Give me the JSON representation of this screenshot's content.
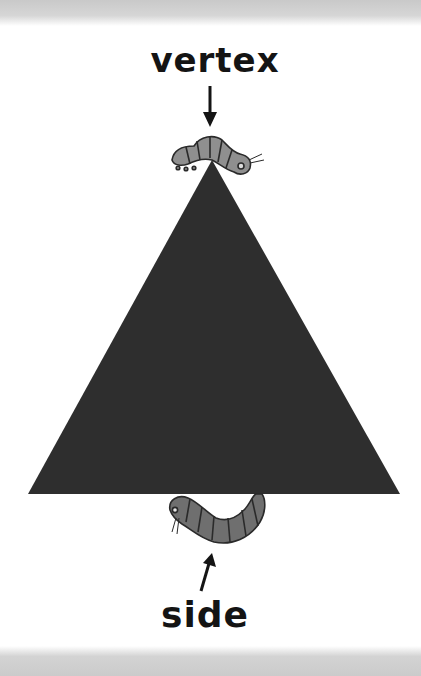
{
  "diagram": {
    "labels": {
      "vertex": "vertex",
      "side": "side"
    },
    "shape": {
      "type": "triangle",
      "fill": "#2e2e2e",
      "points": [
        [
          212,
          160
        ],
        [
          28,
          494
        ],
        [
          400,
          494
        ]
      ]
    },
    "figures": [
      {
        "name": "caterpillar-on-vertex",
        "position": "top apex"
      },
      {
        "name": "caterpillar-under-side",
        "position": "bottom side"
      }
    ],
    "colors": {
      "caterpillar_body": "#8a8a8a",
      "caterpillar_outline": "#2a2a2a",
      "label_text": "#141414",
      "band": "#cbcbcb"
    }
  }
}
